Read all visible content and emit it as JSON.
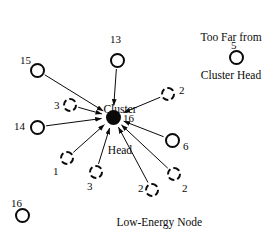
{
  "figure": {
    "title": "",
    "background_color": "#ffffff",
    "stroke_color": "#0a0a0a",
    "width": 279,
    "height": 235
  },
  "annotations": {
    "too_far_line1": "Too Far from",
    "too_far_line2": "Cluster Head",
    "cluster_head_line1": "Cluster",
    "cluster_head_line2": "Head",
    "low_energy_caption": "Low-Energy Node"
  },
  "hub": {
    "id": "cluster-head",
    "label": "16",
    "style": "filled",
    "cx": 113,
    "cy": 117,
    "r": 7.5,
    "label_x": 123,
    "label_y": 112
  },
  "nodes": [
    {
      "id": "node-13",
      "label": "13",
      "style": "solid",
      "connected": true,
      "cx": 117,
      "cy": 60,
      "r": 7.5,
      "label_x": 110,
      "label_y": 33
    },
    {
      "id": "node-15",
      "label": "15",
      "style": "solid",
      "connected": true,
      "cx": 37,
      "cy": 70,
      "r": 7.5,
      "label_x": 20,
      "label_y": 54
    },
    {
      "id": "node-3a",
      "label": "3",
      "style": "dashed",
      "connected": true,
      "cx": 70,
      "cy": 105,
      "r": 7.0,
      "label_x": 54,
      "label_y": 99
    },
    {
      "id": "node-14",
      "label": "14",
      "style": "solid",
      "connected": true,
      "cx": 37,
      "cy": 127,
      "r": 7.5,
      "label_x": 14,
      "label_y": 120
    },
    {
      "id": "node-1",
      "label": "1",
      "style": "dashed",
      "connected": true,
      "cx": 67,
      "cy": 158,
      "r": 7.0,
      "label_x": 53,
      "label_y": 165
    },
    {
      "id": "node-3b",
      "label": "3",
      "style": "dashed",
      "connected": true,
      "cx": 96,
      "cy": 172,
      "r": 7.0,
      "label_x": 87,
      "label_y": 180
    },
    {
      "id": "node-2c",
      "label": "2",
      "style": "dashed",
      "connected": true,
      "cx": 152,
      "cy": 190,
      "r": 7.0,
      "label_x": 138,
      "label_y": 182
    },
    {
      "id": "node-2b",
      "label": "2",
      "style": "dashed",
      "connected": true,
      "cx": 174,
      "cy": 174,
      "r": 7.0,
      "label_x": 182,
      "label_y": 182
    },
    {
      "id": "node-6",
      "label": "6",
      "style": "solid",
      "connected": true,
      "cx": 172,
      "cy": 140,
      "r": 7.5,
      "label_x": 183,
      "label_y": 140
    },
    {
      "id": "node-2a",
      "label": "2",
      "style": "dashed",
      "connected": true,
      "cx": 168,
      "cy": 94,
      "r": 7.0,
      "label_x": 179,
      "label_y": 84
    },
    {
      "id": "node-5",
      "label": "5",
      "style": "solid",
      "connected": false,
      "cx": 236,
      "cy": 57,
      "r": 7.5,
      "label_x": 231,
      "label_y": 39
    },
    {
      "id": "node-16-far",
      "label": "16",
      "style": "solid",
      "connected": false,
      "cx": 22,
      "cy": 215,
      "r": 7.5,
      "label_x": 11,
      "label_y": 197
    }
  ],
  "legend": {
    "too_far_x": 231,
    "too_far_y": 6,
    "cluster_head_x": 113,
    "cluster_head_y": 79,
    "low_energy_x": 152,
    "low_energy_y": 204
  }
}
